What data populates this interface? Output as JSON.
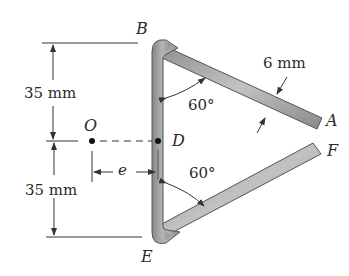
{
  "figure": {
    "points": {
      "A": "A",
      "B": "B",
      "D": "D",
      "E": "E",
      "F": "F",
      "O": "O"
    },
    "dimensions": {
      "upper_height": "35 mm",
      "lower_height": "35 mm",
      "thickness": "6 mm",
      "eccentricity": "e"
    },
    "angles": {
      "upper": "60°",
      "lower": "60°"
    },
    "colors": {
      "member_fill": "#9a9a9a",
      "member_edge": "#555555",
      "line": "#333333",
      "text": "#2a2a2a"
    }
  }
}
